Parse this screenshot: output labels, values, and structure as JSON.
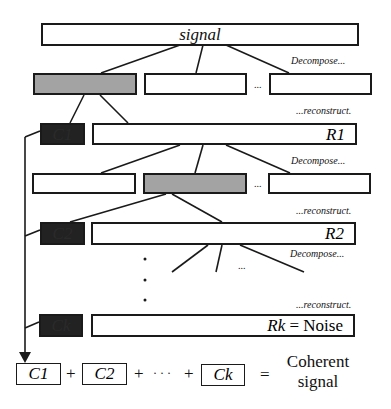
{
  "diagram": {
    "root": {
      "label": "signal"
    },
    "annotations": {
      "decompose": "Decompose...",
      "reconstruct": "...reconstruct.",
      "ellipsis": "...",
      "vdots": "·"
    },
    "levels": [
      {
        "coherent": "C1",
        "residual": "R1"
      },
      {
        "coherent": "C2",
        "residual": "R2"
      },
      {
        "coherent": "Ck",
        "residual": "Rk = Noise",
        "residual_var": "Rk",
        "residual_eq": " = Noise"
      }
    ],
    "sum": {
      "terms": [
        "C1",
        "C2",
        "Ck"
      ],
      "plus": "+",
      "dots": "· · ·",
      "equals": "=",
      "result_line1": "Coherent",
      "result_line2": "signal"
    },
    "colors": {
      "selected_branch": "#a3a3a3",
      "coherent_component": "#222222",
      "stroke": "#1a1a1a",
      "background": "#ffffff"
    }
  }
}
